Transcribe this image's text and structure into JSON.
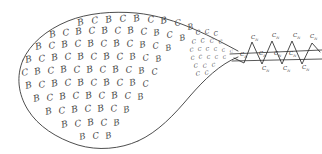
{
  "figure": {
    "background_color": "#ffffff",
    "ink_color": "#3a3a3a",
    "glyph_color": "#4a4a4a",
    "label_color": "#333333"
  },
  "symbols": {
    "b": "B",
    "c": "C",
    "lattice_label_base": "C",
    "lattice_label_subscript": "N"
  },
  "body_glyphs": [
    {
      "char": "B",
      "x": 78,
      "y": 26,
      "size": 9,
      "rot": -14
    },
    {
      "char": "C",
      "x": 92,
      "y": 24,
      "size": 9,
      "rot": -10
    },
    {
      "char": "B",
      "x": 106,
      "y": 23,
      "size": 9,
      "rot": -12
    },
    {
      "char": "C",
      "x": 120,
      "y": 22,
      "size": 9,
      "rot": -8
    },
    {
      "char": "B",
      "x": 134,
      "y": 22,
      "size": 9,
      "rot": -13
    },
    {
      "char": "C",
      "x": 148,
      "y": 23,
      "size": 9,
      "rot": -9
    },
    {
      "char": "B",
      "x": 161,
      "y": 24,
      "size": 9,
      "rot": -12
    },
    {
      "char": "C",
      "x": 175,
      "y": 26,
      "size": 8.5,
      "rot": -8
    },
    {
      "char": "B",
      "x": 188,
      "y": 30,
      "size": 8,
      "rot": -11
    },
    {
      "char": "B",
      "x": 50,
      "y": 38,
      "size": 9,
      "rot": -14
    },
    {
      "char": "C",
      "x": 63,
      "y": 36,
      "size": 9,
      "rot": -9
    },
    {
      "char": "B",
      "x": 76,
      "y": 35,
      "size": 9,
      "rot": -13
    },
    {
      "char": "C",
      "x": 89,
      "y": 34,
      "size": 9,
      "rot": -8
    },
    {
      "char": "B",
      "x": 102,
      "y": 34,
      "size": 9,
      "rot": -12
    },
    {
      "char": "C",
      "x": 115,
      "y": 34,
      "size": 9,
      "rot": -9
    },
    {
      "char": "B",
      "x": 128,
      "y": 34,
      "size": 9,
      "rot": -13
    },
    {
      "char": "C",
      "x": 141,
      "y": 35,
      "size": 9,
      "rot": -8
    },
    {
      "char": "B",
      "x": 154,
      "y": 36,
      "size": 8.6,
      "rot": -12
    },
    {
      "char": "C",
      "x": 167,
      "y": 38,
      "size": 8.4,
      "rot": -9
    },
    {
      "char": "B",
      "x": 180,
      "y": 41,
      "size": 8,
      "rot": -12
    },
    {
      "char": "B",
      "x": 36,
      "y": 50,
      "size": 9,
      "rot": -14
    },
    {
      "char": "C",
      "x": 49,
      "y": 49,
      "size": 9,
      "rot": -9
    },
    {
      "char": "B",
      "x": 62,
      "y": 48,
      "size": 9,
      "rot": -13
    },
    {
      "char": "C",
      "x": 75,
      "y": 47,
      "size": 9,
      "rot": -8
    },
    {
      "char": "B",
      "x": 88,
      "y": 47,
      "size": 9,
      "rot": -12
    },
    {
      "char": "C",
      "x": 101,
      "y": 47,
      "size": 9,
      "rot": -9
    },
    {
      "char": "B",
      "x": 114,
      "y": 47,
      "size": 9,
      "rot": -13
    },
    {
      "char": "C",
      "x": 127,
      "y": 47,
      "size": 9,
      "rot": -8
    },
    {
      "char": "B",
      "x": 140,
      "y": 48,
      "size": 8.6,
      "rot": -12
    },
    {
      "char": "C",
      "x": 153,
      "y": 49,
      "size": 8.4,
      "rot": -9
    },
    {
      "char": "B",
      "x": 166,
      "y": 51,
      "size": 8,
      "rot": -12
    },
    {
      "char": "B",
      "x": 26,
      "y": 63,
      "size": 9,
      "rot": -14
    },
    {
      "char": "C",
      "x": 39,
      "y": 62,
      "size": 9,
      "rot": -9
    },
    {
      "char": "B",
      "x": 52,
      "y": 61,
      "size": 9,
      "rot": -13
    },
    {
      "char": "C",
      "x": 65,
      "y": 60,
      "size": 9,
      "rot": -8
    },
    {
      "char": "B",
      "x": 78,
      "y": 60,
      "size": 9,
      "rot": -12
    },
    {
      "char": "C",
      "x": 91,
      "y": 60,
      "size": 9,
      "rot": -9
    },
    {
      "char": "B",
      "x": 104,
      "y": 60,
      "size": 9,
      "rot": -13
    },
    {
      "char": "C",
      "x": 117,
      "y": 60,
      "size": 9,
      "rot": -8
    },
    {
      "char": "B",
      "x": 130,
      "y": 60,
      "size": 8.8,
      "rot": -12
    },
    {
      "char": "C",
      "x": 143,
      "y": 61,
      "size": 8.5,
      "rot": -9
    },
    {
      "char": "B",
      "x": 156,
      "y": 62,
      "size": 8.2,
      "rot": -12
    },
    {
      "char": "C",
      "x": 22,
      "y": 76,
      "size": 9,
      "rot": -10
    },
    {
      "char": "B",
      "x": 35,
      "y": 75,
      "size": 9,
      "rot": -14
    },
    {
      "char": "C",
      "x": 48,
      "y": 74,
      "size": 9,
      "rot": -9
    },
    {
      "char": "B",
      "x": 61,
      "y": 73,
      "size": 9,
      "rot": -13
    },
    {
      "char": "C",
      "x": 74,
      "y": 73,
      "size": 9,
      "rot": -8
    },
    {
      "char": "B",
      "x": 87,
      "y": 73,
      "size": 9,
      "rot": -12
    },
    {
      "char": "C",
      "x": 100,
      "y": 73,
      "size": 9,
      "rot": -9
    },
    {
      "char": "B",
      "x": 113,
      "y": 73,
      "size": 9,
      "rot": -13
    },
    {
      "char": "C",
      "x": 126,
      "y": 73,
      "size": 8.8,
      "rot": -8
    },
    {
      "char": "B",
      "x": 139,
      "y": 74,
      "size": 8.5,
      "rot": -12
    },
    {
      "char": "C",
      "x": 152,
      "y": 75,
      "size": 8.2,
      "rot": -9
    },
    {
      "char": "B",
      "x": 26,
      "y": 89,
      "size": 9,
      "rot": -14
    },
    {
      "char": "C",
      "x": 39,
      "y": 88,
      "size": 9,
      "rot": -9
    },
    {
      "char": "B",
      "x": 52,
      "y": 87,
      "size": 9,
      "rot": -13
    },
    {
      "char": "C",
      "x": 65,
      "y": 86,
      "size": 9,
      "rot": -8
    },
    {
      "char": "B",
      "x": 78,
      "y": 86,
      "size": 9,
      "rot": -12
    },
    {
      "char": "C",
      "x": 91,
      "y": 86,
      "size": 9,
      "rot": -9
    },
    {
      "char": "B",
      "x": 104,
      "y": 86,
      "size": 9,
      "rot": -13
    },
    {
      "char": "C",
      "x": 117,
      "y": 86,
      "size": 9,
      "rot": -8
    },
    {
      "char": "B",
      "x": 130,
      "y": 86,
      "size": 8.8,
      "rot": -12
    },
    {
      "char": "C",
      "x": 143,
      "y": 87,
      "size": 8.4,
      "rot": -9
    },
    {
      "char": "B",
      "x": 34,
      "y": 102,
      "size": 9,
      "rot": -14
    },
    {
      "char": "C",
      "x": 47,
      "y": 101,
      "size": 9,
      "rot": -9
    },
    {
      "char": "B",
      "x": 60,
      "y": 100,
      "size": 9,
      "rot": -13
    },
    {
      "char": "C",
      "x": 73,
      "y": 99,
      "size": 9,
      "rot": -8
    },
    {
      "char": "B",
      "x": 86,
      "y": 99,
      "size": 9,
      "rot": -12
    },
    {
      "char": "C",
      "x": 99,
      "y": 99,
      "size": 9,
      "rot": -9
    },
    {
      "char": "B",
      "x": 112,
      "y": 99,
      "size": 9,
      "rot": -13
    },
    {
      "char": "C",
      "x": 125,
      "y": 99,
      "size": 8.8,
      "rot": -8
    },
    {
      "char": "B",
      "x": 138,
      "y": 100,
      "size": 8.4,
      "rot": -12
    },
    {
      "char": "B",
      "x": 46,
      "y": 115,
      "size": 9,
      "rot": -14
    },
    {
      "char": "C",
      "x": 59,
      "y": 114,
      "size": 9,
      "rot": -9
    },
    {
      "char": "B",
      "x": 72,
      "y": 113,
      "size": 9,
      "rot": -13
    },
    {
      "char": "C",
      "x": 85,
      "y": 112,
      "size": 9,
      "rot": -8
    },
    {
      "char": "B",
      "x": 98,
      "y": 112,
      "size": 9,
      "rot": -12
    },
    {
      "char": "C",
      "x": 111,
      "y": 112,
      "size": 9,
      "rot": -9
    },
    {
      "char": "B",
      "x": 124,
      "y": 113,
      "size": 8.6,
      "rot": -13
    },
    {
      "char": "B",
      "x": 62,
      "y": 128,
      "size": 9,
      "rot": -14
    },
    {
      "char": "C",
      "x": 75,
      "y": 127,
      "size": 9,
      "rot": -9
    },
    {
      "char": "B",
      "x": 88,
      "y": 126,
      "size": 9,
      "rot": -13
    },
    {
      "char": "C",
      "x": 101,
      "y": 126,
      "size": 9,
      "rot": -8
    },
    {
      "char": "B",
      "x": 114,
      "y": 126,
      "size": 8.6,
      "rot": -12
    },
    {
      "char": "B",
      "x": 80,
      "y": 140,
      "size": 8.6,
      "rot": -14
    },
    {
      "char": "C",
      "x": 93,
      "y": 139,
      "size": 8.6,
      "rot": -9
    },
    {
      "char": "B",
      "x": 106,
      "y": 139,
      "size": 8.4,
      "rot": -13
    }
  ],
  "neck_glyphs": [
    {
      "char": "C",
      "x": 196,
      "y": 35,
      "size": 6.4,
      "rot": -10
    },
    {
      "char": "C",
      "x": 205,
      "y": 34,
      "size": 6.2,
      "rot": -8
    },
    {
      "char": "C",
      "x": 214,
      "y": 36,
      "size": 6.0,
      "rot": -11
    },
    {
      "char": "C",
      "x": 192,
      "y": 44,
      "size": 5.8,
      "rot": -9
    },
    {
      "char": "C",
      "x": 201,
      "y": 43,
      "size": 5.6,
      "rot": -12
    },
    {
      "char": "C",
      "x": 210,
      "y": 43,
      "size": 5.4,
      "rot": -8
    },
    {
      "char": "C",
      "x": 219,
      "y": 44,
      "size": 5.2,
      "rot": -10
    },
    {
      "char": "C",
      "x": 190,
      "y": 52,
      "size": 5.2,
      "rot": -10
    },
    {
      "char": "C",
      "x": 198,
      "y": 51,
      "size": 5.0,
      "rot": -8
    },
    {
      "char": "C",
      "x": 206,
      "y": 51,
      "size": 4.8,
      "rot": -11
    },
    {
      "char": "C",
      "x": 214,
      "y": 51,
      "size": 4.6,
      "rot": -9
    },
    {
      "char": "C",
      "x": 222,
      "y": 52,
      "size": 4.4,
      "rot": -10
    },
    {
      "char": "C",
      "x": 230,
      "y": 53,
      "size": 4.2,
      "rot": -8
    },
    {
      "char": "C",
      "x": 191,
      "y": 60,
      "size": 5.2,
      "rot": -9
    },
    {
      "char": "C",
      "x": 199,
      "y": 59,
      "size": 5.0,
      "rot": -12
    },
    {
      "char": "C",
      "x": 207,
      "y": 59,
      "size": 4.8,
      "rot": -8
    },
    {
      "char": "C",
      "x": 215,
      "y": 59,
      "size": 4.6,
      "rot": -10
    },
    {
      "char": "C",
      "x": 223,
      "y": 59,
      "size": 4.4,
      "rot": -9
    },
    {
      "char": "C",
      "x": 194,
      "y": 68,
      "size": 5.6,
      "rot": -10
    },
    {
      "char": "C",
      "x": 203,
      "y": 68,
      "size": 5.4,
      "rot": -8
    },
    {
      "char": "C",
      "x": 212,
      "y": 67,
      "size": 5.0,
      "rot": -11
    },
    {
      "char": "C",
      "x": 196,
      "y": 76,
      "size": 5.8,
      "rot": -9
    },
    {
      "char": "C",
      "x": 205,
      "y": 75,
      "size": 5.4,
      "rot": -11
    }
  ],
  "lattice": {
    "top_labels": [
      {
        "x": 251,
        "y": 39
      },
      {
        "x": 272,
        "y": 37
      },
      {
        "x": 293,
        "y": 37
      },
      {
        "x": 310,
        "y": 38
      }
    ],
    "mid_labels": [
      {
        "x": 240,
        "y": 56
      },
      {
        "x": 259,
        "y": 55
      },
      {
        "x": 274,
        "y": 55
      },
      {
        "x": 289,
        "y": 55
      }
    ],
    "bottom_labels": [
      {
        "x": 262,
        "y": 70
      },
      {
        "x": 283,
        "y": 70
      },
      {
        "x": 302,
        "y": 69
      }
    ]
  }
}
